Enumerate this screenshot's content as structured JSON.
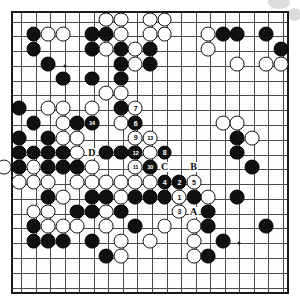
{
  "diagram": {
    "kind": "go-board-diagram",
    "board_size": 19,
    "grid_cols": 19,
    "grid_rows": 19,
    "colors": {
      "black_stone": "#101010",
      "white_stone": "#ffffff",
      "grid_line": "#4a4a4a",
      "border": "#1a1a1a",
      "background": "#fefefe",
      "watermark": "#dcdcdc"
    },
    "star_points": [
      {
        "col": 3,
        "row": 3
      },
      {
        "col": 9,
        "row": 3
      },
      {
        "col": 15,
        "row": 3
      },
      {
        "col": 3,
        "row": 9
      },
      {
        "col": 9,
        "row": 9
      },
      {
        "col": 15,
        "row": 9
      },
      {
        "col": 3,
        "row": 15
      },
      {
        "col": 9,
        "row": 15
      },
      {
        "col": 15,
        "row": 15
      }
    ],
    "stones": [
      {
        "col": 6,
        "row": 0,
        "color": "white"
      },
      {
        "col": 7,
        "row": 0,
        "color": "white"
      },
      {
        "col": 9,
        "row": 0,
        "color": "white"
      },
      {
        "col": 10,
        "row": 0,
        "color": "white"
      },
      {
        "col": 1,
        "row": 1,
        "color": "black"
      },
      {
        "col": 2,
        "row": 1,
        "color": "white"
      },
      {
        "col": 3,
        "row": 1,
        "color": "white"
      },
      {
        "col": 5,
        "row": 1,
        "color": "black"
      },
      {
        "col": 6,
        "row": 1,
        "color": "black"
      },
      {
        "col": 7,
        "row": 1,
        "color": "white"
      },
      {
        "col": 9,
        "row": 1,
        "color": "white"
      },
      {
        "col": 10,
        "row": 1,
        "color": "white"
      },
      {
        "col": 13,
        "row": 1,
        "color": "white"
      },
      {
        "col": 14,
        "row": 1,
        "color": "black"
      },
      {
        "col": 15,
        "row": 1,
        "color": "black"
      },
      {
        "col": 17,
        "row": 1,
        "color": "black"
      },
      {
        "col": 1,
        "row": 2,
        "color": "black"
      },
      {
        "col": 5,
        "row": 2,
        "color": "black"
      },
      {
        "col": 6,
        "row": 2,
        "color": "white"
      },
      {
        "col": 7,
        "row": 2,
        "color": "black"
      },
      {
        "col": 8,
        "row": 2,
        "color": "white"
      },
      {
        "col": 9,
        "row": 2,
        "color": "black"
      },
      {
        "col": 13,
        "row": 2,
        "color": "white"
      },
      {
        "col": 18,
        "row": 2,
        "color": "black"
      },
      {
        "col": 2,
        "row": 3,
        "color": "black"
      },
      {
        "col": 7,
        "row": 3,
        "color": "black"
      },
      {
        "col": 8,
        "row": 3,
        "color": "white"
      },
      {
        "col": 9,
        "row": 3,
        "color": "black"
      },
      {
        "col": 15,
        "row": 3,
        "color": "white"
      },
      {
        "col": 17,
        "row": 3,
        "color": "white"
      },
      {
        "col": 18,
        "row": 3,
        "color": "white"
      },
      {
        "col": 3,
        "row": 4,
        "color": "black"
      },
      {
        "col": 5,
        "row": 4,
        "color": "black"
      },
      {
        "col": 7,
        "row": 4,
        "color": "black"
      },
      {
        "col": 6,
        "row": 5,
        "color": "white"
      },
      {
        "col": 7,
        "row": 5,
        "color": "white"
      },
      {
        "col": 0,
        "row": 6,
        "color": "black"
      },
      {
        "col": 2,
        "row": 6,
        "color": "white"
      },
      {
        "col": 3,
        "row": 6,
        "color": "white"
      },
      {
        "col": 5,
        "row": 6,
        "color": "white"
      },
      {
        "col": 7,
        "row": 6,
        "color": "black"
      },
      {
        "col": 8,
        "row": 6,
        "color": "white",
        "number": "7"
      },
      {
        "col": 1,
        "row": 7,
        "color": "black"
      },
      {
        "col": 3,
        "row": 7,
        "color": "white"
      },
      {
        "col": 4,
        "row": 7,
        "color": "black"
      },
      {
        "col": 5,
        "row": 7,
        "color": "black",
        "number": "14"
      },
      {
        "col": 7,
        "row": 7,
        "color": "white"
      },
      {
        "col": 8,
        "row": 7,
        "color": "black",
        "number": "6"
      },
      {
        "col": 14,
        "row": 7,
        "color": "white"
      },
      {
        "col": 15,
        "row": 7,
        "color": "white"
      },
      {
        "col": 0,
        "row": 8,
        "color": "black"
      },
      {
        "col": 2,
        "row": 8,
        "color": "black"
      },
      {
        "col": 3,
        "row": 8,
        "color": "white"
      },
      {
        "col": 4,
        "row": 8,
        "color": "white"
      },
      {
        "col": 8,
        "row": 8,
        "color": "white",
        "number": "9"
      },
      {
        "col": 9,
        "row": 8,
        "color": "white",
        "number": "13"
      },
      {
        "col": 15,
        "row": 8,
        "color": "black"
      },
      {
        "col": 16,
        "row": 8,
        "color": "white"
      },
      {
        "col": 0,
        "row": 9,
        "color": "black"
      },
      {
        "col": 1,
        "row": 9,
        "color": "black"
      },
      {
        "col": 2,
        "row": 9,
        "color": "black"
      },
      {
        "col": 3,
        "row": 9,
        "color": "black"
      },
      {
        "col": 4,
        "row": 9,
        "color": "white"
      },
      {
        "col": 6,
        "row": 9,
        "color": "black"
      },
      {
        "col": 7,
        "row": 9,
        "color": "black"
      },
      {
        "col": 8,
        "row": 9,
        "color": "black",
        "number": "12"
      },
      {
        "col": 9,
        "row": 9,
        "color": "white"
      },
      {
        "col": 10,
        "row": 9,
        "color": "black",
        "number": "8"
      },
      {
        "col": 15,
        "row": 9,
        "color": "black"
      },
      {
        "col": -1,
        "row": 10,
        "color": "white"
      },
      {
        "col": 0,
        "row": 10,
        "color": "black"
      },
      {
        "col": 1,
        "row": 10,
        "color": "white"
      },
      {
        "col": 2,
        "row": 10,
        "color": "black"
      },
      {
        "col": 3,
        "row": 10,
        "color": "black"
      },
      {
        "col": 4,
        "row": 10,
        "color": "black"
      },
      {
        "col": 5,
        "row": 10,
        "color": "white"
      },
      {
        "col": 8,
        "row": 10,
        "color": "white",
        "number": "11"
      },
      {
        "col": 9,
        "row": 10,
        "color": "black",
        "number": "10"
      },
      {
        "col": 16,
        "row": 10,
        "color": "black"
      },
      {
        "col": 0,
        "row": 11,
        "color": "white"
      },
      {
        "col": 1,
        "row": 11,
        "color": "white"
      },
      {
        "col": 2,
        "row": 11,
        "color": "white"
      },
      {
        "col": 4,
        "row": 11,
        "color": "white"
      },
      {
        "col": 5,
        "row": 11,
        "color": "white"
      },
      {
        "col": 6,
        "row": 11,
        "color": "white"
      },
      {
        "col": 7,
        "row": 11,
        "color": "white"
      },
      {
        "col": 8,
        "row": 11,
        "color": "white"
      },
      {
        "col": 9,
        "row": 11,
        "color": "white"
      },
      {
        "col": 10,
        "row": 11,
        "color": "black",
        "number": "4"
      },
      {
        "col": 11,
        "row": 11,
        "color": "black",
        "number": "2"
      },
      {
        "col": 12,
        "row": 11,
        "color": "white",
        "number": "5"
      },
      {
        "col": 2,
        "row": 12,
        "color": "black"
      },
      {
        "col": 3,
        "row": 12,
        "color": "white"
      },
      {
        "col": 5,
        "row": 12,
        "color": "black"
      },
      {
        "col": 6,
        "row": 12,
        "color": "black"
      },
      {
        "col": 7,
        "row": 12,
        "color": "white"
      },
      {
        "col": 8,
        "row": 12,
        "color": "black"
      },
      {
        "col": 9,
        "row": 12,
        "color": "black"
      },
      {
        "col": 10,
        "row": 12,
        "color": "black"
      },
      {
        "col": 11,
        "row": 12,
        "color": "white",
        "number": "1"
      },
      {
        "col": 12,
        "row": 12,
        "color": "black"
      },
      {
        "col": 13,
        "row": 12,
        "color": "white"
      },
      {
        "col": 15,
        "row": 12,
        "color": "black"
      },
      {
        "col": 1,
        "row": 13,
        "color": "white"
      },
      {
        "col": 2,
        "row": 13,
        "color": "white"
      },
      {
        "col": 4,
        "row": 13,
        "color": "black"
      },
      {
        "col": 5,
        "row": 13,
        "color": "black"
      },
      {
        "col": 6,
        "row": 13,
        "color": "white"
      },
      {
        "col": 7,
        "row": 13,
        "color": "black"
      },
      {
        "col": 11,
        "row": 13,
        "color": "white",
        "number": "3"
      },
      {
        "col": 13,
        "row": 13,
        "color": "black"
      },
      {
        "col": 1,
        "row": 14,
        "color": "black"
      },
      {
        "col": 2,
        "row": 14,
        "color": "white"
      },
      {
        "col": 3,
        "row": 14,
        "color": "white"
      },
      {
        "col": 4,
        "row": 14,
        "color": "white"
      },
      {
        "col": 6,
        "row": 14,
        "color": "white"
      },
      {
        "col": 8,
        "row": 14,
        "color": "black"
      },
      {
        "col": 10,
        "row": 14,
        "color": "white"
      },
      {
        "col": 12,
        "row": 14,
        "color": "white"
      },
      {
        "col": 13,
        "row": 14,
        "color": "black"
      },
      {
        "col": 17,
        "row": 14,
        "color": "black"
      },
      {
        "col": 1,
        "row": 15,
        "color": "black"
      },
      {
        "col": 2,
        "row": 15,
        "color": "black"
      },
      {
        "col": 3,
        "row": 15,
        "color": "black"
      },
      {
        "col": 5,
        "row": 15,
        "color": "black"
      },
      {
        "col": 7,
        "row": 15,
        "color": "white"
      },
      {
        "col": 9,
        "row": 15,
        "color": "white"
      },
      {
        "col": 12,
        "row": 15,
        "color": "white"
      },
      {
        "col": 14,
        "row": 15,
        "color": "black"
      },
      {
        "col": 6,
        "row": 16,
        "color": "black"
      },
      {
        "col": 7,
        "row": 16,
        "color": "white"
      },
      {
        "col": 12,
        "row": 16,
        "color": "white"
      },
      {
        "col": 13,
        "row": 16,
        "color": "black"
      }
    ],
    "labels": [
      {
        "text": "A",
        "col": 12,
        "row": 13
      },
      {
        "text": "B",
        "col": 12,
        "row": 10
      },
      {
        "text": "C",
        "col": 10,
        "row": 10
      },
      {
        "text": "D",
        "col": 5,
        "row": 9
      }
    ],
    "move_numbers": [
      "1",
      "2",
      "3",
      "4",
      "5",
      "6",
      "7",
      "8",
      "9",
      "10",
      "11",
      "12",
      "13",
      "14"
    ]
  }
}
